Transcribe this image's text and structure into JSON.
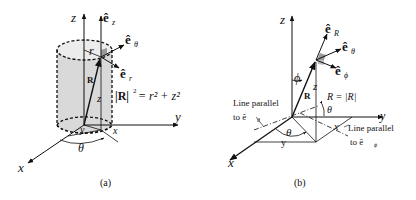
{
  "panels": [
    {
      "id": "a",
      "caption": "(a)",
      "title": "Cylindrical coordinates",
      "axes": {
        "z": "z",
        "y": "y",
        "x": "x"
      },
      "unit_vectors": {
        "ez_hat": "ê",
        "ez_sub": "z",
        "etheta_hat": "ê",
        "etheta_sub": "θ",
        "er_hat": "ê",
        "er_sub": "r"
      },
      "labels": {
        "r": "r",
        "R": "R",
        "z": "z",
        "y_ground": "y",
        "x_ground": "x",
        "theta": "θ",
        "equation_lhs": "|R|",
        "equation_exp": "2",
        "equation_rhs": "= r² + z²"
      }
    },
    {
      "id": "b",
      "caption": "(b)",
      "title": "Spherical coordinates",
      "axes": {
        "z": "z",
        "y": "y",
        "x": "x"
      },
      "unit_vectors": {
        "eR_hat": "ê",
        "eR_sub": "R",
        "etheta_hat": "ê",
        "etheta_sub": "θ",
        "ephi_hat": "ê",
        "ephi_sub": "ϕ"
      },
      "labels": {
        "phi": "ϕ",
        "R": "R",
        "z": "z",
        "R_mag": "R = |R|",
        "theta_top": "θ",
        "theta_ground": "θ",
        "y_ground": "y",
        "x_ground": "x",
        "line_parallel_theta_1": "Line parallel",
        "line_parallel_theta_2": "to ê",
        "line_parallel_theta_sub": "θ",
        "line_parallel_phi_1": "Line parallel",
        "line_parallel_phi_2": "to ê",
        "line_parallel_phi_sub": "ϕ"
      }
    }
  ],
  "colors": {
    "ink": "#111111",
    "cylinder_fill": "#d9d9d9",
    "cylinder_top": "#ececec",
    "right_angle_mark": "#9a9a9a"
  }
}
